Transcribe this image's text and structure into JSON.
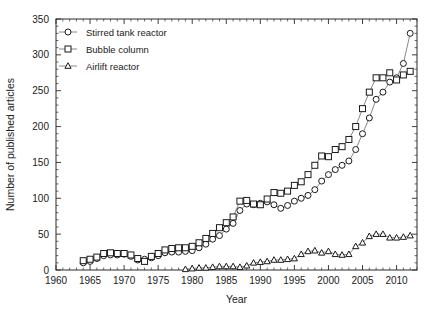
{
  "chart_data": {
    "type": "line",
    "title": "",
    "xlabel": "Year",
    "ylabel": "Number of published articles",
    "xlim": [
      1960,
      2013
    ],
    "ylim": [
      0,
      350
    ],
    "xticks": [
      1960,
      1965,
      1970,
      1975,
      1980,
      1985,
      1990,
      1995,
      2000,
      2005,
      2010
    ],
    "yticks": [
      0,
      50,
      100,
      150,
      200,
      250,
      300,
      350
    ],
    "xtick_labels": [
      "1960",
      "1965",
      "1970",
      "1975",
      "1980",
      "1985",
      "1990",
      "1995",
      "2000",
      "2005",
      "2010"
    ],
    "ytick_labels": [
      "0",
      "50",
      "100",
      "150",
      "200",
      "250",
      "300",
      "350"
    ],
    "minor_tick_interval": 1,
    "grid": false,
    "legend_position": "top-left",
    "series": [
      {
        "name": "Stirred tank reactor",
        "marker": "circle",
        "x": [
          1964,
          1965,
          1966,
          1967,
          1968,
          1969,
          1970,
          1971,
          1972,
          1973,
          1974,
          1975,
          1976,
          1977,
          1978,
          1979,
          1980,
          1981,
          1982,
          1983,
          1984,
          1985,
          1986,
          1987,
          1988,
          1989,
          1990,
          1991,
          1992,
          1993,
          1994,
          1995,
          1996,
          1997,
          1998,
          1999,
          2000,
          2001,
          2002,
          2003,
          2004,
          2005,
          2006,
          2007,
          2008,
          2009,
          2010,
          2011,
          2012
        ],
        "values": [
          10,
          12,
          16,
          20,
          21,
          21,
          22,
          19,
          14,
          15,
          17,
          20,
          24,
          25,
          25,
          26,
          27,
          31,
          36,
          43,
          48,
          57,
          65,
          83,
          92,
          91,
          93,
          95,
          91,
          86,
          90,
          96,
          100,
          104,
          112,
          124,
          133,
          140,
          146,
          152,
          168,
          190,
          212,
          238,
          248,
          262,
          268,
          288,
          330
        ]
      },
      {
        "name": "Bubble column",
        "marker": "square",
        "x": [
          1964,
          1965,
          1966,
          1967,
          1968,
          1969,
          1970,
          1971,
          1972,
          1973,
          1974,
          1975,
          1976,
          1977,
          1978,
          1979,
          1980,
          1981,
          1982,
          1983,
          1984,
          1985,
          1986,
          1987,
          1988,
          1989,
          1990,
          1991,
          1992,
          1993,
          1994,
          1995,
          1996,
          1997,
          1998,
          1999,
          2000,
          2001,
          2002,
          2003,
          2004,
          2005,
          2006,
          2007,
          2008,
          2009,
          2010,
          2011,
          2012
        ],
        "values": [
          13,
          15,
          18,
          23,
          24,
          23,
          23,
          21,
          16,
          12,
          19,
          23,
          28,
          30,
          31,
          31,
          33,
          38,
          44,
          51,
          59,
          66,
          74,
          96,
          97,
          92,
          91,
          99,
          108,
          107,
          110,
          118,
          123,
          133,
          146,
          159,
          158,
          168,
          172,
          182,
          200,
          225,
          248,
          268,
          268,
          275,
          265,
          272,
          277
        ]
      },
      {
        "name": "Airlift reactor",
        "marker": "triangle",
        "x": [
          1979,
          1980,
          1981,
          1982,
          1983,
          1984,
          1985,
          1986,
          1987,
          1988,
          1989,
          1990,
          1991,
          1992,
          1993,
          1994,
          1995,
          1996,
          1997,
          1998,
          1999,
          2000,
          2001,
          2002,
          2003,
          2004,
          2005,
          2006,
          2007,
          2008,
          2009,
          2010,
          2011,
          2012
        ],
        "values": [
          1,
          2,
          3,
          3,
          4,
          5,
          5,
          5,
          4,
          6,
          10,
          11,
          12,
          14,
          14,
          15,
          16,
          22,
          26,
          27,
          24,
          26,
          22,
          21,
          22,
          33,
          38,
          47,
          50,
          50,
          45,
          45,
          46,
          48
        ]
      }
    ]
  },
  "legend": {
    "items": [
      {
        "label": "Stirred tank reactor",
        "marker": "circle"
      },
      {
        "label": "Bubble column",
        "marker": "square"
      },
      {
        "label": "Airlift reactor",
        "marker": "triangle"
      }
    ]
  }
}
